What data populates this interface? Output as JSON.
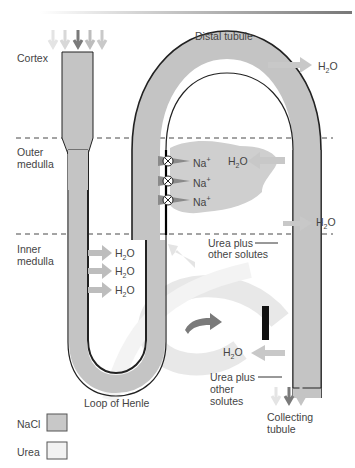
{
  "diagram": {
    "zones": {
      "cortex": "Cortex",
      "outer_medulla_1": "Outer",
      "outer_medulla_2": "medulla",
      "inner_medulla_1": "Inner",
      "inner_medulla_2": "medulla"
    },
    "structures": {
      "distal_tubule": "Distal tubule",
      "loop_of_henle": "Loop of Henle",
      "collecting_tubule_1": "Collecting",
      "collecting_tubule_2": "tubule"
    },
    "labels": {
      "h2o": "H",
      "h2o_sub": "2",
      "h2o_tail": "O",
      "na": "Na",
      "na_sup": "+",
      "urea_upper_1": "Urea plus",
      "urea_upper_2": "other solutes",
      "urea_lower_1": "Urea plus",
      "urea_lower_2": "other",
      "urea_lower_3": "solutes"
    },
    "legend": [
      {
        "label": "NaCl",
        "color": "#c8c8c8"
      },
      {
        "label": "Urea",
        "color": "#f2f2f2"
      }
    ],
    "colors": {
      "tubule_fill": "#c4c4c4",
      "outline": "#222222",
      "arrow_dark": "#7a7a7a",
      "arrow_light": "#c8c8c8",
      "cloud": "#cfcfcf"
    }
  }
}
